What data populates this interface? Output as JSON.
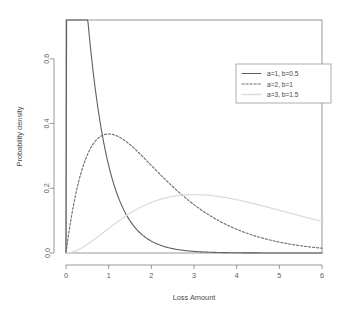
{
  "chart_data": {
    "type": "line",
    "title": "",
    "subtitle": "",
    "xlabel": "Loss Amount",
    "ylabel": "Probability density",
    "xlim": [
      0,
      6
    ],
    "ylim": [
      0,
      0.72
    ],
    "xticks": [
      "0",
      "1",
      "2",
      "3",
      "4",
      "5",
      "6"
    ],
    "xtick_values": [
      0,
      1,
      2,
      3,
      4,
      5,
      6
    ],
    "yticks": [
      "0.0",
      "0.2",
      "0.4",
      "0.6"
    ],
    "ytick_values": [
      0.0,
      0.2,
      0.4,
      0.6
    ],
    "grid": false,
    "legend_position": "top-right",
    "distribution": "gamma",
    "series": [
      {
        "name": "a=1, b=0.5",
        "shape": 1,
        "scale": 0.5,
        "color": "#5f5f5f",
        "dash": "none",
        "width": 1.1,
        "peak_x": 1.0,
        "peak_y": 0.72,
        "x": [
          0,
          0.25,
          0.5,
          0.75,
          1.0,
          1.25,
          1.5,
          1.75,
          2.0,
          2.5,
          3.0,
          3.5,
          4.0,
          4.5,
          5.0,
          5.5,
          6.0
        ],
        "y": [
          0.01,
          0.23,
          0.55,
          0.69,
          0.72,
          0.66,
          0.55,
          0.43,
          0.31,
          0.15,
          0.07,
          0.03,
          0.015,
          0.008,
          0.004,
          0.002,
          0.001
        ]
      },
      {
        "name": "a=2, b=1",
        "shape": 2,
        "scale": 1,
        "color": "#6a6a6a",
        "dash": "2.2 1.8",
        "width": 1.1,
        "peak_x": 2.0,
        "peak_y": 0.365,
        "x": [
          0,
          0.25,
          0.5,
          0.75,
          1.0,
          1.25,
          1.5,
          1.75,
          2.0,
          2.5,
          3.0,
          3.5,
          4.0,
          4.5,
          5.0,
          5.5,
          6.0
        ],
        "y": [
          0.01,
          0.06,
          0.12,
          0.19,
          0.25,
          0.29,
          0.33,
          0.355,
          0.365,
          0.35,
          0.3,
          0.24,
          0.185,
          0.135,
          0.095,
          0.055,
          0.02
        ]
      },
      {
        "name": "a=3, b=1.5",
        "shape": 3,
        "scale": 1.5,
        "color": "#dcdcdc",
        "dash": "none",
        "width": 1.3,
        "peak_x": 3.0,
        "peak_y": 0.245,
        "x": [
          0,
          0.25,
          0.5,
          0.75,
          1.0,
          1.25,
          1.5,
          1.75,
          2.0,
          2.5,
          3.0,
          3.5,
          4.0,
          4.5,
          5.0,
          5.5,
          6.0
        ],
        "y": [
          0.0,
          0.012,
          0.03,
          0.055,
          0.085,
          0.115,
          0.145,
          0.17,
          0.195,
          0.228,
          0.245,
          0.243,
          0.228,
          0.2,
          0.17,
          0.13,
          0.09
        ]
      }
    ]
  },
  "legend": {
    "entries": [
      {
        "label": "a=1, b=0.5"
      },
      {
        "label": "a=2, b=1"
      },
      {
        "label": "a=3, b=1.5"
      }
    ]
  }
}
